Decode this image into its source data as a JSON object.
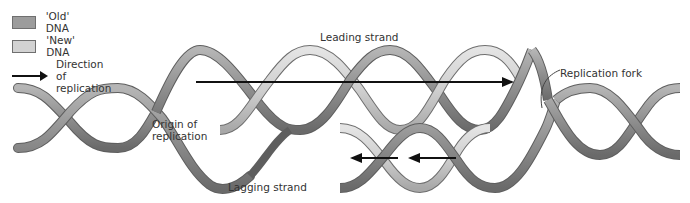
{
  "legend": {
    "items": [
      {
        "label": "'Old' DNA",
        "kind": "swatch",
        "color": "#9c9c9c"
      },
      {
        "label": "'New' DNA",
        "kind": "swatch",
        "color": "#d2d2d2"
      },
      {
        "label": "Direction of replication",
        "kind": "arrow",
        "lines": [
          "Direction of",
          "replication"
        ]
      }
    ]
  },
  "labels": {
    "leading_strand": "Leading strand",
    "lagging_strand": "Lagging strand",
    "origin": [
      "Origin of",
      "replication"
    ],
    "replication_fork": "Replication fork"
  },
  "colors": {
    "old_dna": "#9c9c9c",
    "old_dna_dark": "#6e6e6e",
    "new_dna": "#d2d2d2",
    "arrow": "#111111"
  }
}
